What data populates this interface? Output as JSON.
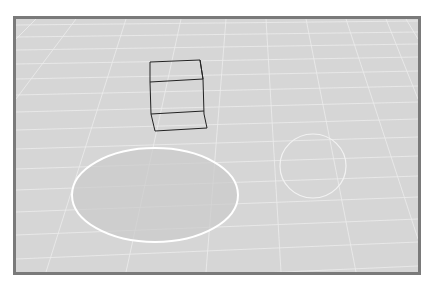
{
  "scene": {
    "background_color": "#d6d6d6",
    "border_color": "#7a7a7a",
    "grid_color": "#efefef",
    "objects": [
      {
        "type": "wireframe-cube",
        "stroke": "#222222"
      },
      {
        "type": "ellipse",
        "fill": "#cdcdcd",
        "stroke": "#ffffff"
      },
      {
        "type": "circle",
        "fill": "none",
        "stroke": "#f2f2f2"
      }
    ]
  }
}
